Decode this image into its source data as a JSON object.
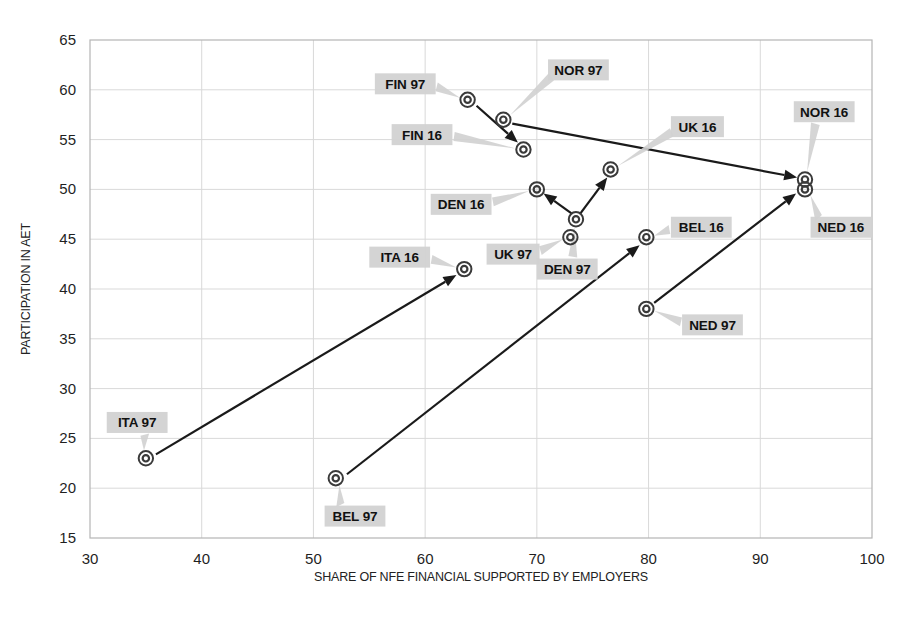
{
  "chart_data": {
    "type": "scatter",
    "title": "",
    "xlabel": "SHARE OF NFE FINANCIAL SUPPORTED BY EMPLOYERS",
    "ylabel": "PARTICIPATION IN AET",
    "xlim": [
      30,
      100
    ],
    "ylim": [
      15,
      65
    ],
    "xticks": [
      30,
      40,
      50,
      60,
      70,
      80,
      90,
      100
    ],
    "yticks": [
      15,
      20,
      25,
      30,
      35,
      40,
      45,
      50,
      55,
      60,
      65
    ],
    "grid": true,
    "legend": "none",
    "marker_style": "concentric-circle",
    "points": [
      {
        "label": "FIN 97",
        "x": 63.8,
        "y": 59.0,
        "label_x": 55.5,
        "label_y": 60.6
      },
      {
        "label": "NOR 97",
        "x": 67.0,
        "y": 57.0,
        "label_x": 71.0,
        "label_y": 62.0
      },
      {
        "label": "FIN 16",
        "x": 68.8,
        "y": 54.0,
        "label_x": 57.0,
        "label_y": 55.5
      },
      {
        "label": "DEN 16",
        "x": 70.0,
        "y": 50.0,
        "label_x": 60.5,
        "label_y": 48.5
      },
      {
        "label": "UK 97",
        "x": 73.0,
        "y": 45.2,
        "label_x": 65.5,
        "label_y": 43.5
      },
      {
        "label": "DEN 97",
        "x": 73.5,
        "y": 47.0,
        "label_x": 70.0,
        "label_y": 42.0
      },
      {
        "label": "UK 16",
        "x": 76.6,
        "y": 52.0,
        "label_x": 82.0,
        "label_y": 56.3
      },
      {
        "label": "BEL 16",
        "x": 79.8,
        "y": 45.2,
        "label_x": 82.0,
        "label_y": 46.2
      },
      {
        "label": "NED 97",
        "x": 79.8,
        "y": 38.0,
        "label_x": 83.0,
        "label_y": 36.4
      },
      {
        "label": "NOR 16",
        "x": 94.0,
        "y": 51.0,
        "label_x": 93.0,
        "label_y": 57.8
      },
      {
        "label": "NED 16",
        "x": 94.0,
        "y": 50.0,
        "label_x": 94.5,
        "label_y": 46.2
      },
      {
        "label": "ITA 16",
        "x": 63.5,
        "y": 42.0,
        "label_x": 55.0,
        "label_y": 43.2
      },
      {
        "label": "ITA 97",
        "x": 35.0,
        "y": 23.0,
        "label_x": 31.5,
        "label_y": 26.6
      },
      {
        "label": "BEL 97",
        "x": 52.0,
        "y": 21.0,
        "label_x": 51.0,
        "label_y": 17.2
      }
    ],
    "arrows": [
      {
        "name": "fin-97-to-fin-16",
        "from": [
          64.6,
          58.4
        ],
        "to": [
          68.3,
          54.7
        ]
      },
      {
        "name": "nor-97-to-nor-16",
        "from": [
          67.8,
          56.6
        ],
        "to": [
          93.3,
          51.2
        ]
      },
      {
        "name": "den-97-to-den-16",
        "from": [
          73.1,
          47.6
        ],
        "to": [
          70.6,
          49.6
        ]
      },
      {
        "name": "den-97-to-uk-16",
        "from": [
          73.9,
          47.6
        ],
        "to": [
          76.3,
          51.2
        ]
      },
      {
        "name": "bel-97-to-bel-16",
        "from": [
          53.0,
          21.4
        ],
        "to": [
          79.2,
          44.4
        ]
      },
      {
        "name": "ned-97-to-ned-16",
        "from": [
          80.5,
          38.6
        ],
        "to": [
          93.2,
          49.6
        ]
      },
      {
        "name": "ita-97-to-ita-16",
        "from": [
          35.9,
          23.4
        ],
        "to": [
          62.8,
          41.4
        ]
      }
    ]
  }
}
